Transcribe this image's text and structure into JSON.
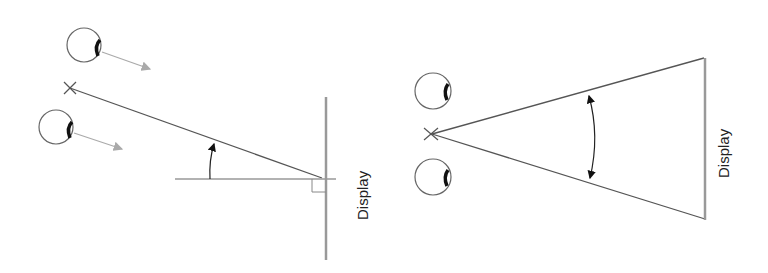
{
  "diagrams": [
    {
      "id": "left",
      "title": "Viewing angle (vertical tilt)",
      "display_label": "Display",
      "elements": [
        "eye-upper",
        "eye-lower",
        "focal-point-x",
        "sight-line",
        "horizontal-reference",
        "display-plane",
        "right-angle-marker",
        "angle-arrow",
        "gaze-arrow-upper",
        "gaze-arrow-lower"
      ]
    },
    {
      "id": "right",
      "title": "Field of view (horizontal)",
      "display_label": "Display",
      "elements": [
        "eye-upper",
        "eye-lower",
        "focal-point-x",
        "view-cone-upper",
        "view-cone-lower",
        "display-plane",
        "double-angle-arrow"
      ]
    }
  ],
  "colors": {
    "line": "#555555",
    "display": "#999999",
    "arrow_gray": "#aaaaaa",
    "text": "#222222"
  }
}
